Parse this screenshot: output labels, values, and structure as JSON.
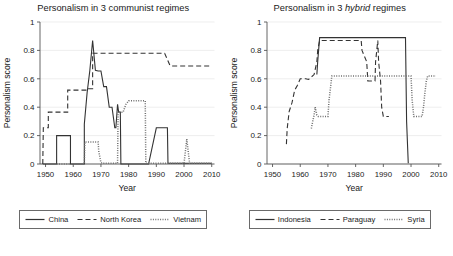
{
  "figure": {
    "background": "#ffffff",
    "panel_count": 2,
    "line_color": "#333333",
    "grid_color": "#e6e6e6",
    "axis_color": "#555555"
  },
  "chart_data": [
    {
      "type": "line",
      "title": "Personalism in 3 communist regimes",
      "title_plain": "Personalism in 3 ",
      "title_italic": "",
      "title_tail": "communist regimes",
      "xlabel": "Year",
      "ylabel": "Personalism score",
      "xlim": [
        1948,
        2011
      ],
      "ylim": [
        0,
        1
      ],
      "xticks": [
        1950,
        1960,
        1970,
        1980,
        1990,
        2000,
        2010
      ],
      "xticklabels": [
        "1950",
        "1960",
        "1970",
        "1980",
        "1990",
        "2000",
        "2010"
      ],
      "yticks": [
        0,
        0.2,
        0.4,
        0.6,
        0.8,
        1
      ],
      "yticklabels": [
        "0",
        "0.2",
        "0.4",
        "0.6",
        "0.8",
        "1"
      ],
      "grid": true,
      "legend_position": "below",
      "series": [
        {
          "name": "China",
          "dash": "solid",
          "x": [
            1949,
            1954,
            1954,
            1959,
            1959,
            1964,
            1964,
            1965,
            1966,
            1967,
            1968,
            1969,
            1970,
            1971,
            1972,
            1973,
            1974,
            1975,
            1975.4,
            1976,
            1976.4,
            1977,
            1977.2,
            1987,
            1987.2,
            1990,
            1990.2,
            1994,
            1994.2,
            2010
          ],
          "y": [
            0,
            0,
            0.2,
            0.2,
            0,
            0,
            0.28,
            0.5,
            0.66,
            0.87,
            0.66,
            0.655,
            0.655,
            0.545,
            0.545,
            0.4,
            0.4,
            0.255,
            0.255,
            0.42,
            0.365,
            0.365,
            0,
            0,
            0,
            0.255,
            0.255,
            0.255,
            0.005,
            0.005
          ]
        },
        {
          "name": "North Korea",
          "dash": "dashed",
          "x": [
            1949,
            1949.2,
            1951,
            1951,
            1958,
            1958,
            1960,
            1960,
            1965,
            1965,
            1967,
            1967,
            1993,
            1993,
            1995,
            1995,
            2010
          ],
          "y": [
            0,
            0.255,
            0.255,
            0.365,
            0.365,
            0.52,
            0.52,
            0.52,
            0.52,
            0.53,
            0.53,
            0.78,
            0.78,
            0.78,
            0.69,
            0.69,
            0.69
          ]
        },
        {
          "name": "Vietnam",
          "dash": "dotted",
          "x": [
            1954,
            1964,
            1964.2,
            1969,
            1969.2,
            1970,
            1970.5,
            1976,
            1976.2,
            1976.6,
            1978,
            1979,
            1980,
            1986,
            1986.2,
            2000,
            2000.5,
            2001,
            2001.5,
            2002,
            2010
          ],
          "y": [
            0,
            0,
            0.155,
            0.155,
            0.09,
            0.01,
            0.005,
            0.005,
            0.37,
            0.365,
            0.365,
            0.42,
            0.445,
            0.445,
            0.005,
            0.005,
            0.09,
            0.175,
            0.09,
            0.005,
            0.005
          ]
        }
      ]
    },
    {
      "type": "line",
      "title": "Personalism in 3 hybrid regimes",
      "title_plain": "Personalism in 3 ",
      "title_italic": "hybrid",
      "title_tail": " regimes",
      "xlabel": "Year",
      "ylabel": "Personalism score",
      "xlim": [
        1948,
        2011
      ],
      "ylim": [
        0,
        1
      ],
      "xticks": [
        1950,
        1960,
        1970,
        1980,
        1990,
        2000,
        2010
      ],
      "xticklabels": [
        "1950",
        "1960",
        "1970",
        "1980",
        "1990",
        "2000",
        "2010"
      ],
      "yticks": [
        0,
        0.2,
        0.4,
        0.6,
        0.8,
        1
      ],
      "yticklabels": [
        "0",
        "0.2",
        "0.4",
        "0.6",
        "0.8",
        "1"
      ],
      "grid": true,
      "legend_position": "below",
      "series": [
        {
          "name": "Indonesia",
          "dash": "solid",
          "x": [
            1966,
            1966.3,
            1967,
            1998,
            1998.4,
            1999
          ],
          "y": [
            0.63,
            0.72,
            0.89,
            0.89,
            0.3,
            0.005
          ]
        },
        {
          "name": "Paraguay",
          "dash": "dashed",
          "x": [
            1955,
            1955.3,
            1956,
            1957,
            1958,
            1959,
            1960,
            1962,
            1963,
            1965,
            1966,
            1966.3,
            1967,
            1982,
            1982.3,
            1984,
            1984.4,
            1987,
            1987.2,
            1988,
            1988.3,
            1989,
            1989.4,
            1990,
            1990.3,
            1992
          ],
          "y": [
            0.14,
            0.25,
            0.37,
            0.43,
            0.52,
            0.555,
            0.6,
            0.6,
            0.595,
            0.63,
            0.72,
            0.8,
            0.87,
            0.87,
            0.8,
            0.72,
            0.585,
            0.585,
            0.72,
            0.87,
            0.72,
            0.585,
            0.4,
            0.335,
            0.335,
            0.335
          ]
        },
        {
          "name": "Syria",
          "dash": "dotted",
          "x": [
            1964,
            1964.5,
            1965,
            1965.4,
            1966,
            1966.5,
            1967,
            1968,
            1970,
            1970.4,
            1971,
            1971.4,
            1991,
            1991.4,
            2000,
            2000.4,
            2001,
            2004,
            2004.5,
            2005,
            2005.5,
            2006,
            2009
          ],
          "y": [
            0.25,
            0.3,
            0.345,
            0.4,
            0.345,
            0.335,
            0.335,
            0.335,
            0.335,
            0.45,
            0.55,
            0.62,
            0.62,
            0.62,
            0.62,
            0.45,
            0.335,
            0.335,
            0.4,
            0.5,
            0.58,
            0.62,
            0.62
          ]
        }
      ]
    }
  ],
  "panels": [
    {
      "id": "communist",
      "legend": [
        {
          "label": "China",
          "dash": "solid"
        },
        {
          "label": "North Korea",
          "dash": "dashed"
        },
        {
          "label": "Vietnam",
          "dash": "dotted"
        }
      ]
    },
    {
      "id": "hybrid",
      "legend": [
        {
          "label": "Indonesia",
          "dash": "solid"
        },
        {
          "label": "Paraguay",
          "dash": "dashed"
        },
        {
          "label": "Syria",
          "dash": "dotted"
        }
      ]
    }
  ]
}
